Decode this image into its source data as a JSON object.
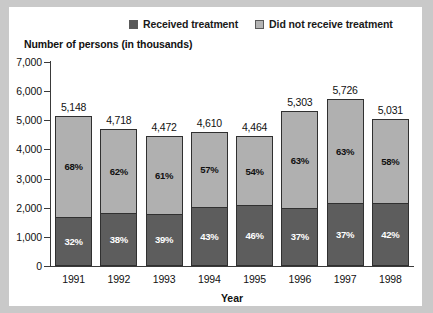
{
  "legend": {
    "items": [
      {
        "label": "Received treatment",
        "swatch": "dark",
        "color": "#585858"
      },
      {
        "label": "Did not receive treatment",
        "swatch": "light",
        "color": "#b4b4b4"
      }
    ]
  },
  "axis_title": "Number of persons (in thousands)",
  "chart_data": {
    "type": "bar",
    "subtype": "stacked-bar",
    "title": "",
    "ylabel": "Number of persons (in thousands)",
    "xlabel": "Year",
    "ylim": [
      0,
      7000
    ],
    "ytick_labels": [
      "7,000",
      "6,000",
      "5,000",
      "4,000",
      "3,000",
      "2,000",
      "1,000",
      "0"
    ],
    "ytick_values": [
      7000,
      6000,
      5000,
      4000,
      3000,
      2000,
      1000,
      0
    ],
    "grid": false,
    "legend_position": "top",
    "categories": [
      "1991",
      "1992",
      "1993",
      "1994",
      "1995",
      "1996",
      "1997",
      "1998"
    ],
    "totals": [
      5148,
      4718,
      4472,
      4610,
      4464,
      5303,
      5726,
      5031
    ],
    "total_labels": [
      "5,148",
      "4,718",
      "4,472",
      "4,610",
      "4,464",
      "5,303",
      "5,726",
      "5,031"
    ],
    "series": [
      {
        "name": "Did not receive treatment",
        "color": "#b0b0b0",
        "unit": "percent",
        "values": [
          68,
          62,
          61,
          57,
          54,
          63,
          63,
          58
        ],
        "labels": [
          "68%",
          "62%",
          "61%",
          "57%",
          "54%",
          "63%",
          "63%",
          "58%"
        ]
      },
      {
        "name": "Received treatment",
        "color": "#5d5d5d",
        "unit": "percent",
        "values": [
          32,
          38,
          39,
          43,
          46,
          37,
          37,
          42
        ],
        "labels": [
          "32%",
          "38%",
          "39%",
          "43%",
          "46%",
          "37%",
          "37%",
          "42%"
        ]
      }
    ]
  }
}
